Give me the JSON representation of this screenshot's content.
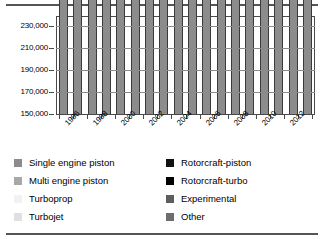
{
  "chart_data": {
    "type": "bar",
    "stacked": true,
    "title": "",
    "subtitle": "",
    "xlabel": "",
    "ylabel": "",
    "ylim": [
      150000,
      238000
    ],
    "yticks": [
      150000,
      170000,
      190000,
      210000,
      230000
    ],
    "ytick_labels": [
      "150,000",
      "170,000",
      "190,000",
      "210,000",
      "230,000"
    ],
    "grid": true,
    "legend_position": "below",
    "categories": [
      1996,
      1997,
      1998,
      1999,
      2000,
      2001,
      2002,
      2003,
      2004,
      2005,
      2006,
      2007,
      2008,
      2009,
      2010,
      2011,
      2012,
      2013
    ],
    "xtick_labels": [
      "1996",
      "",
      "1998",
      "",
      "2000",
      "",
      "2002",
      "",
      "2004",
      "",
      "2006",
      "",
      "2008",
      "",
      "2010",
      "",
      "2012",
      ""
    ],
    "series": [
      {
        "name": "Single engine piston",
        "color": "#8c8c8c",
        "values": [
          155500,
          157000,
          160500,
          168500,
          170000,
          171500,
          170000,
          166500,
          164500,
          165500,
          166000,
          166500,
          167000,
          169000,
          170500,
          171000,
          171500,
          172000
        ]
      },
      {
        "name": "Multi engine piston",
        "color": "#d4d4d4",
        "values": [
          4200,
          4200,
          4400,
          4800,
          4800,
          4800,
          4700,
          4600,
          4600,
          4600,
          4600,
          4600,
          4600,
          4600,
          4600,
          4600,
          4600,
          4600
        ]
      },
      {
        "name": "Turboprop",
        "color": "#ffffff",
        "values": [
          3400,
          3500,
          3600,
          3700,
          3800,
          3900,
          4000,
          4100,
          4200,
          4300,
          4400,
          4500,
          4700,
          4800,
          4900,
          5000,
          5100,
          5200
        ]
      },
      {
        "name": "Turbojet",
        "color": "#ededed",
        "values": [
          3500,
          3600,
          3900,
          4200,
          4500,
          4800,
          5100,
          5400,
          5800,
          6200,
          6700,
          7200,
          7700,
          8000,
          8300,
          8600,
          8900,
          9200
        ]
      },
      {
        "name": "Rotorcraft-piston",
        "color": "#111111",
        "values": [
          2700,
          2800,
          2900,
          3000,
          3100,
          3200,
          3200,
          3300,
          3300,
          3400,
          3400,
          3500,
          3600,
          3600,
          3700,
          3700,
          3800,
          3800
        ]
      },
      {
        "name": "Rotorcraft-turbo",
        "color": "#000000",
        "values": [
          3700,
          3800,
          3900,
          4100,
          4300,
          4400,
          4400,
          4500,
          4500,
          4600,
          4700,
          4800,
          4900,
          5000,
          5100,
          5200,
          5300,
          5400
        ]
      },
      {
        "name": "Experimental",
        "color": "#5e5e5e",
        "values": [
          14500,
          15000,
          16500,
          19000,
          20500,
          20000,
          19500,
          19500,
          20000,
          20500,
          21000,
          21500,
          22000,
          22500,
          23000,
          23500,
          24000,
          24500
        ]
      },
      {
        "name": "Other",
        "color": "#6e6e6e",
        "values": [
          2500,
          2600,
          2700,
          5000,
          5000,
          4800,
          4600,
          4600,
          4600,
          4600,
          4700,
          4800,
          4900,
          5000,
          5100,
          5200,
          5300,
          5400
        ]
      }
    ]
  },
  "legend": {
    "left_items": [
      {
        "label": "Single engine piston",
        "color": "#8c8c8c"
      },
      {
        "label": "Multi engine piston",
        "color": "#a8a8a8"
      },
      {
        "label": "Turboprop",
        "color": "#f2f2f2"
      },
      {
        "label": "Turbojet",
        "color": "#e0e0e0"
      }
    ],
    "right_items": [
      {
        "label": "Rotorcraft-piston",
        "color": "#111111"
      },
      {
        "label": "Rotorcraft-turbo",
        "color": "#000000"
      },
      {
        "label": "Experimental",
        "color": "#5e5e5e"
      },
      {
        "label": "Other",
        "color": "#6e6e6e"
      }
    ]
  }
}
